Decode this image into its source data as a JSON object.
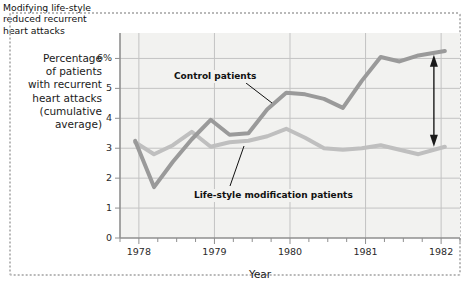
{
  "chart_data": {
    "type": "line",
    "title": "",
    "subtitle": "",
    "xlabel": "Year",
    "ylabel": "Percentage of patients with recurrent heart attacks (cumulative average)",
    "ylabel_lines": [
      "Percentage",
      "of patients",
      "with recurrent",
      "heart attacks",
      "(cumulative",
      "average)"
    ],
    "xlim": [
      1977.75,
      1982.25
    ],
    "ylim": [
      0,
      6.85
    ],
    "grid": true,
    "grid_axes": "both",
    "legend_position": "inline-annotations",
    "y_ticks": [
      {
        "value": 0,
        "label": "0"
      },
      {
        "value": 1,
        "label": "1"
      },
      {
        "value": 2,
        "label": "2"
      },
      {
        "value": 3,
        "label": "3"
      },
      {
        "value": 4,
        "label": "4"
      },
      {
        "value": 5,
        "label": "5"
      },
      {
        "value": 6,
        "label": "6%"
      }
    ],
    "x_ticks": [
      {
        "value": 1978,
        "label": "1978"
      },
      {
        "value": 1979,
        "label": "1979"
      },
      {
        "value": 1980,
        "label": "1980"
      },
      {
        "value": 1981,
        "label": "1981"
      },
      {
        "value": 1982,
        "label": "1982"
      }
    ],
    "x_minor_tick_interval": 0.25,
    "series": [
      {
        "name": "Control patients",
        "color": "#9a9a9a",
        "line_width": 4.0,
        "x": [
          1977.95,
          1978.2,
          1978.45,
          1978.7,
          1978.95,
          1979.2,
          1979.45,
          1979.7,
          1979.95,
          1980.2,
          1980.45,
          1980.7,
          1980.95,
          1981.2,
          1981.45,
          1981.7,
          1982.05
        ],
        "values": [
          3.25,
          1.7,
          2.55,
          3.3,
          3.95,
          3.45,
          3.5,
          4.3,
          4.85,
          4.8,
          4.65,
          4.35,
          5.25,
          6.05,
          5.9,
          6.1,
          6.25
        ]
      },
      {
        "name": "Life-style modification patients",
        "color": "#bfbfbf",
        "line_width": 4.0,
        "x": [
          1977.95,
          1978.2,
          1978.45,
          1978.7,
          1978.95,
          1979.2,
          1979.45,
          1979.7,
          1979.95,
          1980.2,
          1980.45,
          1980.7,
          1980.95,
          1981.2,
          1981.45,
          1981.7,
          1982.05
        ],
        "values": [
          3.2,
          2.8,
          3.1,
          3.55,
          3.05,
          3.2,
          3.25,
          3.4,
          3.65,
          3.35,
          3.0,
          2.95,
          3.0,
          3.1,
          2.95,
          2.8,
          3.05
        ]
      }
    ],
    "annotations": [
      {
        "id": "control-patients",
        "text": "Control patients",
        "type": "label-with-leader",
        "target_x": 1979.9,
        "target_y": 4.5
      },
      {
        "id": "lifestyle-patients",
        "text": "Life-style modification patients",
        "type": "label-with-leader",
        "target_x": 1979.5,
        "target_y": 3.35
      },
      {
        "id": "callout",
        "text": "Modifying life-style reduced recurrent heart attacks",
        "text_lines": [
          "Modifying life-style",
          "reduced recurrent",
          "heart attacks"
        ],
        "type": "double-arrow-callout",
        "arrow_x": 1982.05,
        "arrow_y_top": 6.12,
        "arrow_y_bottom": 3.05,
        "gap_value": 3.07
      }
    ],
    "colors": {
      "plot_background": "#f2f2f0",
      "grid": "#c3c3c3",
      "axis": "#8f8f8f",
      "control_series": "#9a9a9a",
      "lifestyle_series": "#bfbfbf",
      "arrow": "#1a1a1a",
      "figure_border": "#b9b9b9",
      "text": "#1a1a1a"
    }
  }
}
